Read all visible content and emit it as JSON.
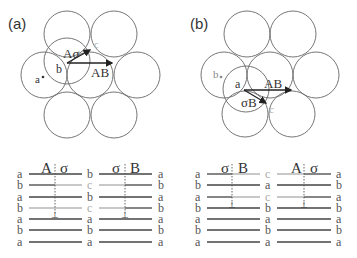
{
  "panels": [
    {
      "label": "(a)",
      "point_labels": {
        "a": "a",
        "b": "b",
        "c": "c"
      },
      "vectors": [
        {
          "label": "Aσ"
        },
        {
          "label": "AB"
        }
      ],
      "stacking": {
        "left_header": "A",
        "left_header2": "σ",
        "right_header": "σ",
        "right_header2": "B",
        "left_col": [
          "a",
          "b",
          "a",
          "b",
          "a",
          "b",
          "a"
        ],
        "mid_col": [
          "b",
          "c",
          "b",
          "c",
          "a",
          "b",
          "a"
        ],
        "right_col": [
          "a",
          "b",
          "a",
          "b",
          "a",
          "b",
          "a"
        ],
        "burgers_symbol": "⊥"
      }
    },
    {
      "label": "(b)",
      "point_labels": {
        "a": "a",
        "b": "b",
        "c": "c"
      },
      "vectors": [
        {
          "label": "σB"
        },
        {
          "label": "AB"
        }
      ],
      "stacking": {
        "left_header": "σ",
        "left_header2": "B",
        "right_header": "A",
        "right_header2": "σ",
        "left_col": [
          "a",
          "b",
          "a",
          "b",
          "a",
          "b",
          "a"
        ],
        "mid_col": [
          "c",
          "a",
          "c",
          "b",
          "a",
          "b",
          "a"
        ],
        "right_col": [
          "a",
          "b",
          "a",
          "b",
          "a",
          "b",
          "a"
        ],
        "burgers_symbol": "⊥"
      }
    }
  ],
  "colors": {
    "line": "#555555",
    "text": "#333333",
    "c_gray": "#aaaaaa"
  }
}
